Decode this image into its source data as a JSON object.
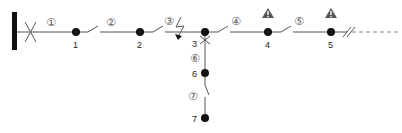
{
  "diagram": {
    "type": "distribution-feeder-single-line",
    "busbar": {
      "x": 14,
      "y1": 12,
      "y2": 50
    },
    "main_line_y": 32,
    "nodes": [
      {
        "id": "1",
        "label": "1",
        "x": 76,
        "y": 32
      },
      {
        "id": "2",
        "label": "2",
        "x": 140,
        "y": 32
      },
      {
        "id": "3",
        "label": "3",
        "x": 205,
        "y": 32
      },
      {
        "id": "4",
        "label": "4",
        "x": 268,
        "y": 32
      },
      {
        "id": "5",
        "label": "5",
        "x": 331,
        "y": 32
      },
      {
        "id": "6",
        "label": "6",
        "x": 205,
        "y": 73
      },
      {
        "id": "7",
        "label": "7",
        "x": 205,
        "y": 118
      }
    ],
    "segments": [
      {
        "id": "1",
        "label": "①"
      },
      {
        "id": "2",
        "label": "②"
      },
      {
        "id": "3",
        "label": "③"
      },
      {
        "id": "4",
        "label": "④"
      },
      {
        "id": "5",
        "label": "⑤"
      },
      {
        "id": "6",
        "label": "⑥"
      },
      {
        "id": "7",
        "label": "⑦"
      }
    ],
    "breaker_symbol": "X",
    "fault_symbol": "lightning-bolt",
    "warnings": [
      {
        "node": "4",
        "symbol": "!"
      },
      {
        "node": "5",
        "symbol": "!"
      }
    ],
    "continuation": "dashed-line"
  },
  "colors": {
    "line": "#555555",
    "node": "#111111",
    "warning": "#555555"
  }
}
